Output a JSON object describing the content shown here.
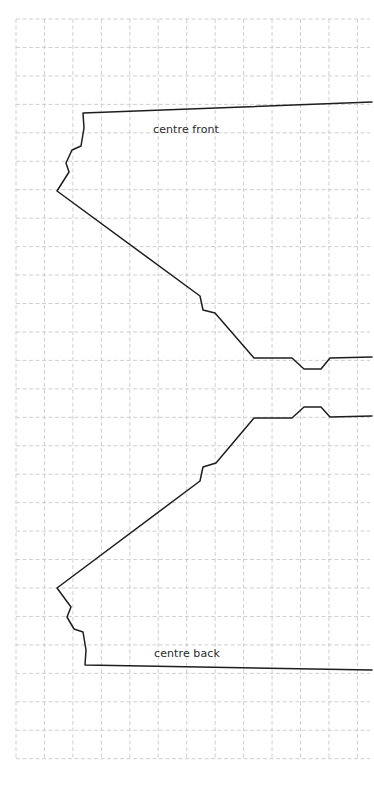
{
  "diagram": {
    "type": "sewing-pattern",
    "grid": {
      "x0": 16,
      "y0": 19,
      "cell": 28.45,
      "cols": 13,
      "rows": 26,
      "right_edge": 370,
      "color": "#c9c9c9",
      "dash": "4 2.5"
    },
    "stroke_color": "#1e1e1e",
    "labels": {
      "front": "centre front",
      "back": "centre back"
    },
    "pieces": [
      {
        "name": "front-piece-outline",
        "points": [
          [
            372,
            102
          ],
          [
            83,
            113
          ],
          [
            84,
            128
          ],
          [
            81,
            146
          ],
          [
            72,
            150
          ],
          [
            66,
            163
          ],
          [
            69,
            172
          ],
          [
            57,
            191
          ],
          [
            200,
            296
          ],
          [
            203,
            310
          ],
          [
            215,
            313
          ],
          [
            254,
            358
          ],
          [
            292,
            358
          ],
          [
            304,
            369
          ],
          [
            321,
            369
          ],
          [
            330,
            358
          ],
          [
            372,
            357
          ]
        ]
      },
      {
        "name": "back-piece-outline",
        "points": [
          [
            372,
            416
          ],
          [
            330,
            417
          ],
          [
            321,
            407
          ],
          [
            304,
            407
          ],
          [
            292,
            418
          ],
          [
            254,
            418
          ],
          [
            216,
            463
          ],
          [
            203,
            467
          ],
          [
            200,
            481
          ],
          [
            57,
            588
          ],
          [
            71,
            607
          ],
          [
            67,
            617
          ],
          [
            74,
            629
          ],
          [
            83,
            632
          ],
          [
            86,
            650
          ],
          [
            85,
            665
          ],
          [
            372,
            670
          ]
        ]
      }
    ]
  }
}
